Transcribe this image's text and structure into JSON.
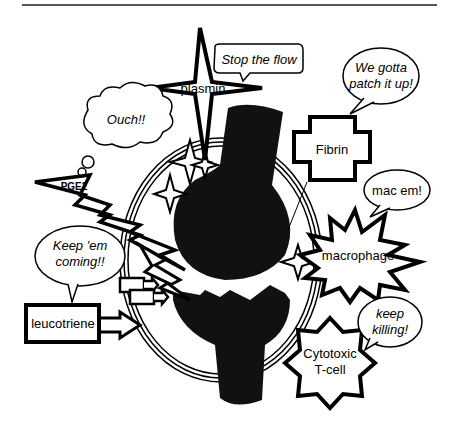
{
  "diagram": {
    "type": "cartoon immune response illustration",
    "actors": [
      {
        "id": "plasmin",
        "label": "plasmin",
        "shape": "4-point star",
        "speech": "Stop the flow"
      },
      {
        "id": "fibrin",
        "label": "Fibrin",
        "shape": "cross",
        "speech": [
          "We gotta",
          "patch it up!"
        ]
      },
      {
        "id": "pge2",
        "label": "PGE2",
        "shape": "lightning bolt",
        "speech": "Ouch!!",
        "speech_type": "thought"
      },
      {
        "id": "macrophage",
        "label": "macrophage",
        "shape": "explosion",
        "speech": "mac em!"
      },
      {
        "id": "leucotriene",
        "label": "leucotriene",
        "shape": "box with arrow",
        "speech": [
          "Keep 'em",
          "coming!!"
        ]
      },
      {
        "id": "tcell",
        "label": [
          "Cytotoxic",
          "T-cell"
        ],
        "shape": "8-point star",
        "speech": [
          "keep",
          "killing!"
        ]
      }
    ],
    "center": "broken bone / vessel inside capsule"
  },
  "colors": {
    "ink": "#000000",
    "paper": "#ffffff",
    "rule": "#555555"
  }
}
